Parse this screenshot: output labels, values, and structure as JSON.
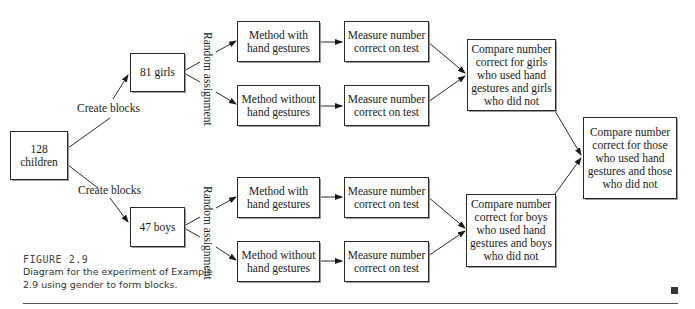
{
  "diagram": {
    "nodes": {
      "root": {
        "lines": [
          "128",
          "children"
        ]
      },
      "girls": {
        "lines": [
          "81 girls"
        ]
      },
      "boys": {
        "lines": [
          "47 boys"
        ]
      },
      "g_with": {
        "lines": [
          "Method with",
          "hand gestures"
        ]
      },
      "g_without": {
        "lines": [
          "Method without",
          "hand gestures"
        ]
      },
      "g_measure1": {
        "lines": [
          "Measure number",
          "correct on test"
        ]
      },
      "g_measure2": {
        "lines": [
          "Measure number",
          "correct on test"
        ]
      },
      "b_with": {
        "lines": [
          "Method with",
          "hand gestures"
        ]
      },
      "b_without": {
        "lines": [
          "Method without",
          "hand gestures"
        ]
      },
      "b_measure1": {
        "lines": [
          "Measure number",
          "correct on test"
        ]
      },
      "b_measure2": {
        "lines": [
          "Measure number",
          "correct on test"
        ]
      },
      "g_compare": {
        "lines": [
          "Compare number",
          "correct for girls",
          "who used hand",
          "gestures and girls",
          "who did not"
        ]
      },
      "b_compare": {
        "lines": [
          "Compare number",
          "correct for boys",
          "who used hand",
          "gestures and boys",
          "who did not"
        ]
      },
      "final_compare": {
        "lines": [
          "Compare number",
          "correct for those",
          "who used hand",
          "gestures and those",
          "who did not"
        ]
      }
    },
    "edge_labels": {
      "create_blocks_top": "Create blocks",
      "create_blocks_bottom": "Create blocks",
      "random_top": "Random assignment",
      "random_bottom": "Random assignment"
    }
  },
  "caption": {
    "title": "FIGURE  2.9",
    "text": "Diagram for the experiment of Example 2.9 using gender to form blocks."
  }
}
